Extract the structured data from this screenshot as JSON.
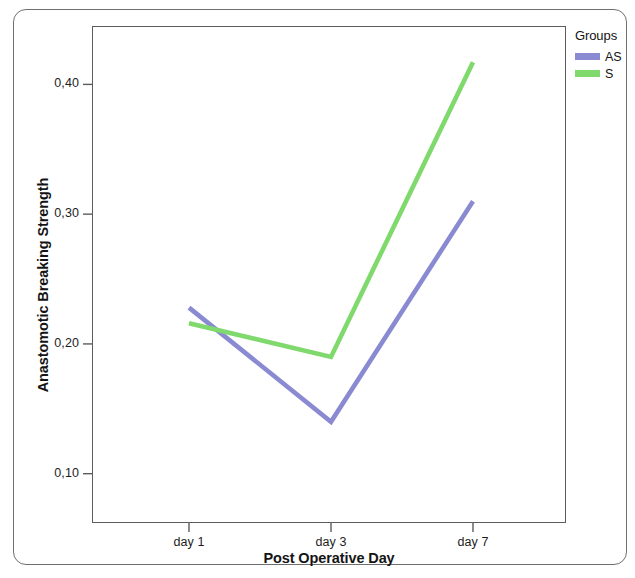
{
  "chart_data": {
    "type": "line",
    "title": "",
    "xlabel": "Post Operative Day",
    "ylabel": "Anastomotic Breaking Strength",
    "categories": [
      "day 1",
      "day 3",
      "day 7"
    ],
    "xtick_labels": [
      "day 1",
      "day 3",
      "day 7"
    ],
    "ytick_labels": [
      "0,10",
      "0,20",
      "0,30",
      "0,40"
    ],
    "ytick_values": [
      0.1,
      0.2,
      0.3,
      0.4
    ],
    "ylim": [
      0.062,
      0.445
    ],
    "grid": false,
    "legend_position": "right",
    "legend_title": "Groups",
    "series": [
      {
        "name": "AS",
        "color": "#8a8ad2",
        "values": [
          0.228,
          0.14,
          0.31
        ]
      },
      {
        "name": "S",
        "color": "#7fd96c",
        "values": [
          0.216,
          0.19,
          0.417
        ]
      }
    ]
  },
  "legend": {
    "title": "Groups",
    "entries": [
      {
        "label": "AS",
        "color": "#8a8ad2"
      },
      {
        "label": "S",
        "color": "#7fd96c"
      }
    ]
  },
  "axes": {
    "x_title": "Post Operative Day",
    "y_title": "Anastomotic Breaking Strength",
    "x_ticks": [
      "day 1",
      "day 3",
      "day 7"
    ],
    "y_ticks": [
      "0,10",
      "0,20",
      "0,30",
      "0,40"
    ]
  }
}
